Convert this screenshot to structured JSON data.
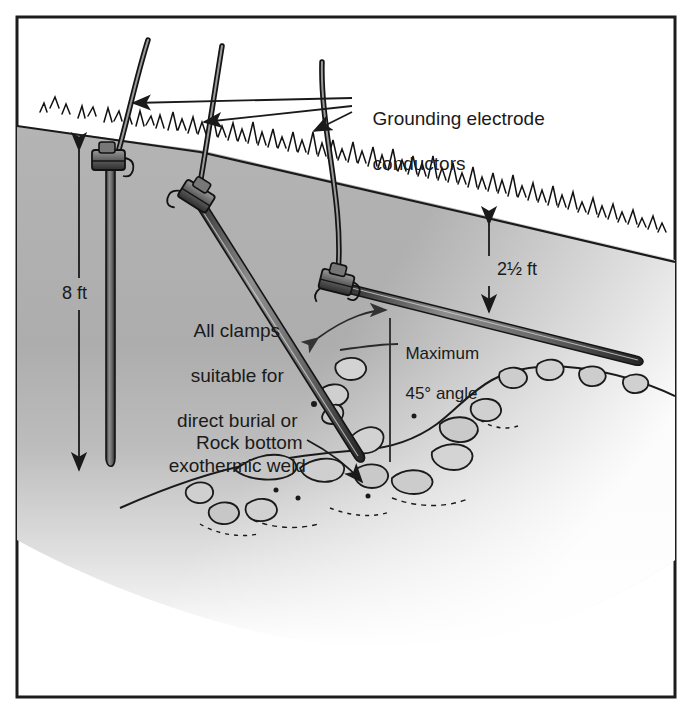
{
  "figure": {
    "kind": "technical-illustration",
    "border_color": "#1c1c1c",
    "soil_color_top": "#b0b0b0",
    "soil_color_bottom": "#ffffff",
    "line_color": "#1a1a1a",
    "text_color": "#1a1a1a",
    "background": "#ffffff"
  },
  "labels": {
    "conductors": {
      "line1": "Grounding electrode",
      "line2": "conductors",
      "x": 362,
      "y": 88,
      "size": 19
    },
    "clamps": {
      "line1": "All clamps",
      "line2": "suitable for",
      "line3": "direct burial or",
      "line4": "exothermic weld",
      "x": 142,
      "y": 300,
      "size": 19
    },
    "max_angle": {
      "line1": "Maximum",
      "line2": "45° angle",
      "x": 392,
      "y": 325,
      "size": 17
    },
    "rock_bottom": {
      "text": "Rock bottom",
      "x": 196,
      "y": 433,
      "size": 19
    },
    "depth_8ft": {
      "text": "8 ft",
      "x": 68,
      "y": 294,
      "size": 18
    },
    "depth_2half_ft": {
      "text": "2½ ft",
      "x": 478,
      "y": 268,
      "size": 18
    }
  },
  "dimensions": {
    "rod_length": "8 ft",
    "burial_depth": "2½ ft",
    "max_angle": "45°"
  },
  "elements": {
    "rods": [
      {
        "name": "vertical-ground-rod",
        "orientation": "vertical"
      },
      {
        "name": "angled-ground-rod",
        "orientation": "45-degree-diagonal"
      },
      {
        "name": "horizontal-ground-rod",
        "orientation": "near-horizontal"
      }
    ],
    "clamps": [
      {
        "name": "clamp-vertical-rod"
      },
      {
        "name": "clamp-angled-rod"
      },
      {
        "name": "clamp-horizontal-rod"
      }
    ],
    "conductors": 3,
    "rock_layer": "rock bottom outcrop below soil"
  }
}
